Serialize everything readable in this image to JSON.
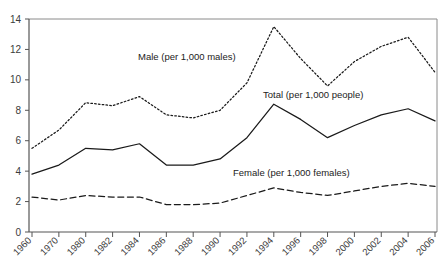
{
  "chart_data": {
    "type": "line",
    "title": "",
    "xlabel": "",
    "ylabel": "",
    "ylim": [
      0,
      14
    ],
    "yticks": [
      0,
      2,
      4,
      6,
      8,
      10,
      12,
      14
    ],
    "grid": false,
    "legend_position": "inline-annotations",
    "categories": [
      "1960",
      "1970",
      "1980",
      "1982",
      "1984",
      "1986",
      "1988",
      "1990",
      "1992",
      "1994",
      "1996",
      "1998",
      "2000",
      "2002",
      "2004",
      "2006"
    ],
    "x": [
      1960,
      1970,
      1980,
      1982,
      1984,
      1986,
      1988,
      1990,
      1992,
      1994,
      1996,
      1998,
      2000,
      2002,
      2004,
      2006
    ],
    "series": [
      {
        "name": "Male (per 1,000 males)",
        "style": "dotted",
        "values": [
          5.5,
          6.7,
          8.5,
          8.3,
          8.9,
          7.7,
          7.5,
          8.0,
          9.8,
          13.5,
          11.4,
          9.6,
          11.2,
          12.2,
          12.8,
          10.5
        ]
      },
      {
        "name": "Total (per 1,000 people)",
        "style": "solid",
        "values": [
          3.8,
          4.4,
          5.5,
          5.4,
          5.8,
          4.4,
          4.4,
          4.8,
          6.2,
          8.4,
          7.4,
          6.2,
          7.0,
          7.7,
          8.1,
          7.3
        ]
      },
      {
        "name": "Female (per 1,000 females)",
        "style": "dashed",
        "values": [
          2.3,
          2.1,
          2.4,
          2.3,
          2.3,
          1.8,
          1.8,
          1.9,
          2.4,
          2.9,
          2.6,
          2.4,
          2.7,
          3.0,
          3.2,
          3.0
        ]
      }
    ],
    "annotations": [
      {
        "text": "Male (per 1,000 males)",
        "x_px": 138,
        "y_px": 60
      },
      {
        "text": "Total (per 1,000 people)",
        "x_px": 263,
        "y_px": 98
      },
      {
        "text": "Female (per 1,000 females)",
        "x_px": 233,
        "y_px": 176
      }
    ]
  },
  "axis": {
    "y_tick_labels": [
      "14",
      "12",
      "10",
      "8",
      "6",
      "4",
      "2",
      "0"
    ],
    "x_tick_labels": [
      "1960",
      "1970",
      "1980",
      "1982",
      "1984",
      "1986",
      "1988",
      "1990",
      "1992",
      "1994",
      "1996",
      "1998",
      "2000",
      "2002",
      "2004",
      "2006"
    ]
  },
  "colors": {
    "line": "#1a1a1a",
    "axis": "#555555",
    "frame": "#8a8a8a",
    "text": "#3b3b3b",
    "background": "#ffffff"
  }
}
